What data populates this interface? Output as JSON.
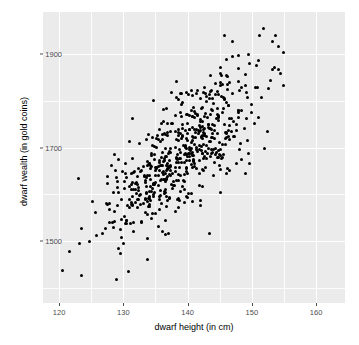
{
  "chart_data": {
    "type": "scatter",
    "title": "",
    "xlabel": "dwarf height (in cm)",
    "ylabel": "dwarf wealth (in gold coins)",
    "xlim": [
      117.5,
      164.5
    ],
    "ylim": [
      1368,
      1990
    ],
    "xticks": [
      120,
      130,
      140,
      150,
      160
    ],
    "xtick_labels": [
      "120",
      "130",
      "140",
      "150",
      "160"
    ],
    "yticks": [
      1500,
      1700,
      1900
    ],
    "ytick_labels": [
      "1500",
      "1700",
      "1900"
    ],
    "x_minor_ticks": [
      125,
      135,
      145,
      155
    ],
    "y_minor_ticks": [
      1400,
      1600,
      1800,
      1900
    ],
    "grid": true,
    "legend": "none",
    "n_points": 600,
    "point_color": "#000000",
    "point_size_px": 3,
    "panel_background": "#ebebeb",
    "gridline_color": "#ffffff",
    "correlation": 0.78,
    "x_mean": 139.5,
    "x_sd": 6.4,
    "y_mean": 1690,
    "y_sd": 98
  },
  "axes": {
    "x_title": "dwarf height (in cm)",
    "y_title": "dwarf wealth (in gold coins)"
  }
}
